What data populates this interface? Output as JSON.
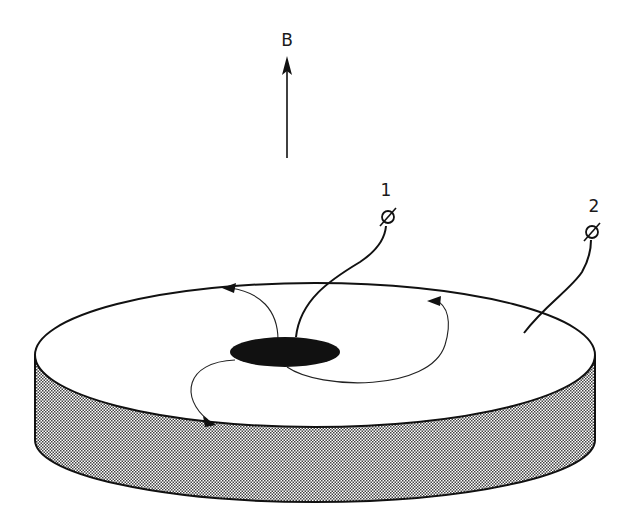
{
  "diagram": {
    "type": "Corbino disk in magnetic field",
    "field_label": "B",
    "terminals": [
      {
        "label": "1",
        "connects_to": "center electrode"
      },
      {
        "label": "2",
        "connects_to": "outer rim"
      }
    ],
    "colors": {
      "ink": "#111111",
      "background": "#ffffff",
      "side_hatch": "#555555",
      "center_electrode": "#111111"
    }
  }
}
